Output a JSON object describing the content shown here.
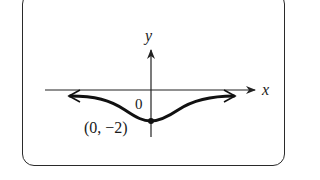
{
  "figure": {
    "axis_labels": {
      "x": "x",
      "y": "y"
    },
    "origin_label": "0",
    "point_label": "(0, −2)",
    "point": {
      "x": 0,
      "y": -2
    }
  },
  "colors": {
    "curve": "#111111",
    "axes": "#222222",
    "frame": "#2a2a2a",
    "background": "#ffffff"
  }
}
